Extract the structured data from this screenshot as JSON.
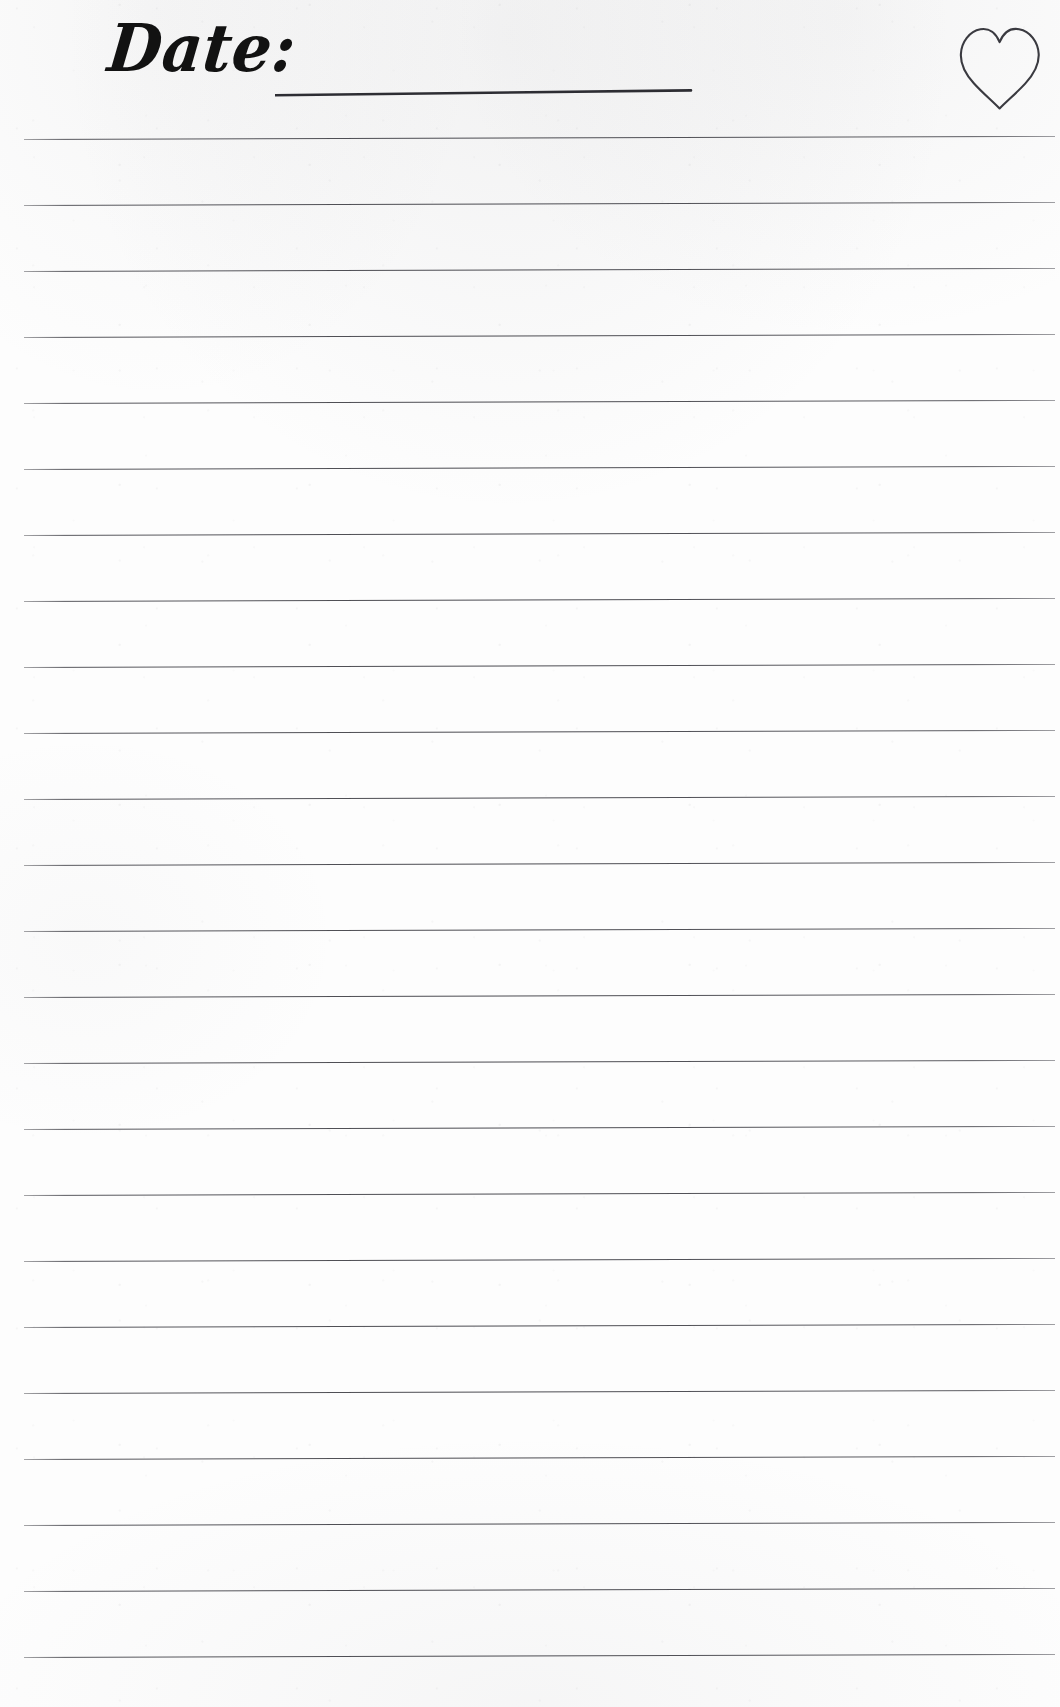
{
  "document": {
    "kind": "lined-journal-page",
    "width": 1060,
    "height": 1707,
    "paper_color": "#fdfdfd",
    "ink_color": "#121212",
    "rule_color": "#4a4a50"
  },
  "header": {
    "date_label": "Date:",
    "date_value": "",
    "date_rule": {
      "name": "date-write-in-rule",
      "x_start": 275,
      "x_end": 691,
      "y_start": 95,
      "y_end": 90
    },
    "heart": {
      "name": "heart-icon",
      "style": "hand-drawn-outline",
      "filled": false,
      "stroke_color": "#3a3a40",
      "x": 960,
      "y": 26,
      "width": 80,
      "height": 80
    }
  },
  "body": {
    "rule_count": 24,
    "rule_first_y": 139,
    "rule_spacing": 66,
    "rule_x_start": 24,
    "rule_x_end": 1055,
    "rule_thickness": 1,
    "rule_slant_px": 3,
    "rules_y": [
      139,
      205,
      271,
      337,
      403,
      469,
      535,
      601,
      667,
      733,
      799,
      865,
      931,
      997,
      1063,
      1129,
      1195,
      1261,
      1327,
      1393,
      1459,
      1525,
      1591,
      1657
    ]
  }
}
